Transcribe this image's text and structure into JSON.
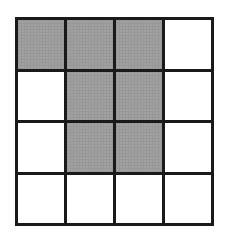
{
  "diagram": {
    "type": "grid",
    "rows": 4,
    "cols": 4,
    "colors": {
      "line": "#1a1a1a",
      "shaded": "#a9a9a9",
      "empty": "#ffffff"
    },
    "cells": [
      [
        true,
        true,
        true,
        false
      ],
      [
        false,
        true,
        true,
        false
      ],
      [
        false,
        true,
        true,
        false
      ],
      [
        false,
        false,
        false,
        false
      ]
    ],
    "shaded_count": 7
  }
}
